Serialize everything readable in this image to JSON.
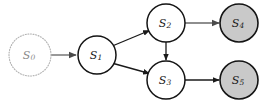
{
  "diagram": {
    "type": "directed-graph",
    "canvas": {
      "width": 264,
      "height": 106,
      "background": "#ffffff"
    },
    "colors": {
      "node_fill": "#ffffff",
      "node_stroke": "#141414",
      "terminal_fill": "#c9c9c9",
      "start_stroke": "#b0b0b0",
      "edge_dark": "#1a1a1a",
      "edge_muted": "#8e8e8e",
      "label": "#1a1a1a",
      "label_faded": "#8a8a8a"
    },
    "nodes": [
      {
        "id": "s0",
        "base": "S",
        "subscript": "0",
        "cx": 30,
        "cy": 55,
        "r": 21,
        "style": "start",
        "faded": true
      },
      {
        "id": "s1",
        "base": "S",
        "subscript": "1",
        "cx": 97,
        "cy": 55,
        "r": 19,
        "style": "normal",
        "faded": false
      },
      {
        "id": "s2",
        "base": "S",
        "subscript": "2",
        "cx": 166,
        "cy": 23,
        "r": 19,
        "style": "normal",
        "faded": false
      },
      {
        "id": "s3",
        "base": "S",
        "subscript": "3",
        "cx": 166,
        "cy": 80,
        "r": 19,
        "style": "normal",
        "faded": false
      },
      {
        "id": "s4",
        "base": "S",
        "subscript": "4",
        "cx": 239,
        "cy": 23,
        "r": 19,
        "style": "terminal",
        "faded": false
      },
      {
        "id": "s5",
        "base": "S",
        "subscript": "5",
        "cx": 239,
        "cy": 80,
        "r": 19,
        "style": "terminal",
        "faded": false
      }
    ],
    "edges": [
      {
        "id": "e-s0-s1",
        "from": "s0",
        "to": "s1",
        "tone": "muted",
        "x1": 51,
        "y1": 55,
        "x2": 76,
        "y2": 55
      },
      {
        "id": "e-s1-s2",
        "from": "s1",
        "to": "s2",
        "tone": "dark",
        "x1": 113.5,
        "y1": 45.5,
        "x2": 149.5,
        "y2": 30.5
      },
      {
        "id": "e-s1-s3",
        "from": "s1",
        "to": "s3",
        "tone": "dark",
        "x1": 113.5,
        "y1": 63.5,
        "x2": 149.5,
        "y2": 73.5
      },
      {
        "id": "e-s2-s3",
        "from": "s2",
        "to": "s3",
        "tone": "dark",
        "x1": 166,
        "y1": 42,
        "x2": 166,
        "y2": 60
      },
      {
        "id": "e-s2-s4",
        "from": "s2",
        "to": "s4",
        "tone": "muted",
        "x1": 185,
        "y1": 23,
        "x2": 219,
        "y2": 23
      },
      {
        "id": "e-s3-s5",
        "from": "s3",
        "to": "s5",
        "tone": "dark",
        "x1": 185,
        "y1": 80,
        "x2": 219,
        "y2": 80
      }
    ]
  }
}
